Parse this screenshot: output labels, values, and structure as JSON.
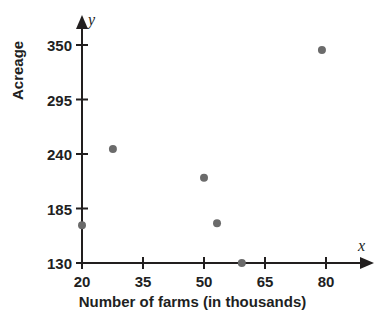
{
  "chart_data": {
    "type": "scatter",
    "title": "",
    "xlabel": "Number of farms (in thousands)",
    "ylabel": "Acreage",
    "x_axis_variable": "x",
    "y_axis_variable": "y",
    "xlim": [
      20,
      85
    ],
    "ylim": [
      130,
      360
    ],
    "xticks": [
      20,
      35,
      50,
      65,
      80
    ],
    "yticks": [
      130,
      185,
      240,
      295,
      350
    ],
    "xtick_labels": [
      "20",
      "35",
      "50",
      "65",
      "80"
    ],
    "ytick_labels": [
      "130",
      "185",
      "240",
      "295",
      "350"
    ],
    "grid": false,
    "legend": false,
    "point_color": "#6b6b6b",
    "axis_color": "#221f1f",
    "points": [
      {
        "x": 20.0,
        "y": 168
      },
      {
        "x": 27.6,
        "y": 245
      },
      {
        "x": 50.0,
        "y": 216
      },
      {
        "x": 53.2,
        "y": 170
      },
      {
        "x": 59.3,
        "y": 130
      },
      {
        "x": 79.0,
        "y": 345
      }
    ]
  },
  "axes": {
    "x_variable_label": "x",
    "y_variable_label": "y",
    "x_title": "Number of farms (in thousands)",
    "y_title": "Acreage"
  }
}
